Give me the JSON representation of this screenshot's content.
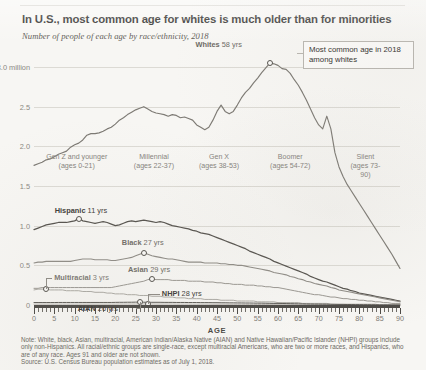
{
  "title": "In U.S., most common age for whites is much older than for minorities",
  "subtitle": "Number of people of each age by race/ethnicity, 2018",
  "callout": "Most common age in 2018 among whites",
  "axis": {
    "x_name": "AGE",
    "x_ticks": [
      0,
      5,
      10,
      15,
      20,
      25,
      30,
      35,
      40,
      45,
      50,
      55,
      60,
      65,
      70,
      75,
      80,
      85,
      90
    ],
    "x_range": [
      0,
      90
    ],
    "y_ticks": [
      "0",
      "0.5",
      "1.0",
      "1.5",
      "2.0",
      "2.5",
      "3.0 million"
    ],
    "y_values": [
      0,
      0.5,
      1.0,
      1.5,
      2.0,
      2.5,
      3.0
    ],
    "y_range": [
      0,
      3.0
    ]
  },
  "generations": [
    {
      "name": "Gen Z and younger",
      "ages": "(ages 0-21)",
      "start": 0,
      "end": 21
    },
    {
      "name": "Millennial",
      "ages": "(ages 22-37)",
      "start": 22,
      "end": 37
    },
    {
      "name": "Gen X",
      "ages": "(ages 38-53)",
      "start": 38,
      "end": 53
    },
    {
      "name": "Boomer",
      "ages": "(ages 54-72)",
      "start": 54,
      "end": 72
    },
    {
      "name": "Silent",
      "ages": "(ages 73-90)",
      "start": 73,
      "end": 90
    }
  ],
  "series_labels": {
    "whites": "Whites 58 yrs",
    "whites_name": "Whites",
    "whites_val": "58 yrs",
    "hispanic_name": "Hispanic",
    "hispanic_val": "11 yrs",
    "black_name": "Black",
    "black_val": "27 yrs",
    "asian_name": "Asian",
    "asian_val": "29 yrs",
    "multiracial_name": "Multiracial",
    "multiracial_val": "3 yrs",
    "nhpi_name": "NHPI",
    "nhpi_val": "28 yrs",
    "aian_name": "AIAN",
    "aian_val": "26 yrs"
  },
  "note": "Note: White, black, Asian, multiracial, American Indian/Alaska Native (AIAN) and Native Hawaiian/Pacific Islander (NHPI) groups include only non-Hispanics. All racial/ethnic groups are single-race, except multiracial Americans, who are two or more races, and Hispanics, who are of any race. Ages 91 and older are not shown.",
  "source": "Source: U.S. Census Bureau population estimates as of July 1, 2018.",
  "colors": {
    "whites": "#7d7a74",
    "hispanic": "#56534e",
    "black": "#8f8c86",
    "asian": "#9a9791",
    "multiracial": "#a8a59f",
    "nhpi": "#b0ada7",
    "aian": "#5c5a55",
    "grid": "#dcdad4",
    "axis": "#4c4a46",
    "background": "#f7f6f3"
  },
  "chart_data": {
    "type": "line",
    "title": "In U.S., most common age for whites is much older than for minorities",
    "subtitle": "Number of people of each age by race/ethnicity, 2018",
    "xlabel": "AGE",
    "ylabel": "Number of people (millions)",
    "xlim": [
      0,
      90
    ],
    "ylim": [
      0,
      3.0
    ],
    "grid": true,
    "legend": "inline-labels",
    "annotations": [
      {
        "text": "Most common age in 2018 among whites",
        "points_to": {
          "series": "Whites",
          "x": 58,
          "y": 3.05
        }
      },
      {
        "text": "Whites 58 yrs",
        "x": 58
      },
      {
        "text": "Hispanic 11 yrs",
        "x": 11
      },
      {
        "text": "Black 27 yrs",
        "x": 27
      },
      {
        "text": "Asian 29 yrs",
        "x": 29
      },
      {
        "text": "Multiracial 3 yrs",
        "x": 3
      },
      {
        "text": "NHPI 28 yrs",
        "x": 28
      },
      {
        "text": "AIAN 26 yrs",
        "x": 26
      }
    ],
    "x": [
      0,
      1,
      2,
      3,
      4,
      5,
      6,
      7,
      8,
      9,
      10,
      11,
      12,
      13,
      14,
      15,
      16,
      17,
      18,
      19,
      20,
      21,
      22,
      23,
      24,
      25,
      26,
      27,
      28,
      29,
      30,
      31,
      32,
      33,
      34,
      35,
      36,
      37,
      38,
      39,
      40,
      41,
      42,
      43,
      44,
      45,
      46,
      47,
      48,
      49,
      50,
      51,
      52,
      53,
      54,
      55,
      56,
      57,
      58,
      59,
      60,
      61,
      62,
      63,
      64,
      65,
      66,
      67,
      68,
      69,
      70,
      71,
      72,
      73,
      74,
      75,
      76,
      77,
      78,
      79,
      80,
      81,
      82,
      83,
      84,
      85,
      86,
      87,
      88,
      89,
      90
    ],
    "series": [
      {
        "name": "Whites",
        "most_common_age": 58,
        "peak_value": 3.05,
        "values": [
          1.76,
          1.78,
          1.8,
          1.83,
          1.84,
          1.87,
          1.9,
          1.92,
          1.94,
          1.99,
          2.02,
          2.04,
          2.08,
          2.14,
          2.16,
          2.16,
          2.17,
          2.19,
          2.22,
          2.24,
          2.28,
          2.33,
          2.36,
          2.4,
          2.43,
          2.46,
          2.48,
          2.5,
          2.47,
          2.44,
          2.42,
          2.41,
          2.4,
          2.38,
          2.4,
          2.39,
          2.36,
          2.37,
          2.35,
          2.33,
          2.27,
          2.24,
          2.21,
          2.24,
          2.33,
          2.44,
          2.52,
          2.44,
          2.41,
          2.44,
          2.52,
          2.61,
          2.68,
          2.73,
          2.8,
          2.86,
          2.93,
          2.99,
          3.05,
          3.04,
          3.02,
          2.98,
          2.97,
          2.92,
          2.84,
          2.77,
          2.68,
          2.58,
          2.47,
          2.36,
          2.27,
          2.22,
          2.38,
          2.22,
          1.92,
          1.74,
          1.62,
          1.52,
          1.44,
          1.36,
          1.28,
          1.2,
          1.12,
          1.04,
          0.96,
          0.88,
          0.8,
          0.72,
          0.64,
          0.55,
          0.46
        ]
      },
      {
        "name": "Hispanic",
        "most_common_age": 11,
        "peak_value": 1.09,
        "values": [
          0.95,
          0.97,
          0.99,
          1.01,
          1.02,
          1.03,
          1.04,
          1.04,
          1.04,
          1.05,
          1.06,
          1.09,
          1.06,
          1.05,
          1.04,
          1.03,
          1.04,
          1.05,
          1.04,
          1.02,
          1.0,
          1.01,
          1.03,
          1.05,
          1.06,
          1.05,
          1.06,
          1.07,
          1.06,
          1.05,
          1.04,
          1.05,
          1.04,
          1.02,
          1.0,
          0.99,
          0.98,
          0.97,
          0.96,
          0.94,
          0.93,
          0.91,
          0.9,
          0.89,
          0.87,
          0.85,
          0.83,
          0.81,
          0.79,
          0.77,
          0.75,
          0.73,
          0.71,
          0.68,
          0.66,
          0.64,
          0.62,
          0.6,
          0.58,
          0.55,
          0.53,
          0.51,
          0.49,
          0.47,
          0.45,
          0.43,
          0.41,
          0.39,
          0.36,
          0.34,
          0.32,
          0.3,
          0.29,
          0.27,
          0.25,
          0.23,
          0.21,
          0.2,
          0.18,
          0.17,
          0.15,
          0.14,
          0.13,
          0.12,
          0.11,
          0.1,
          0.09,
          0.08,
          0.07,
          0.06,
          0.05
        ]
      },
      {
        "name": "Black",
        "most_common_age": 27,
        "peak_value": 0.66,
        "values": [
          0.53,
          0.54,
          0.54,
          0.55,
          0.55,
          0.55,
          0.55,
          0.55,
          0.55,
          0.55,
          0.56,
          0.57,
          0.58,
          0.58,
          0.58,
          0.57,
          0.57,
          0.57,
          0.57,
          0.56,
          0.56,
          0.57,
          0.58,
          0.59,
          0.6,
          0.62,
          0.64,
          0.66,
          0.64,
          0.62,
          0.61,
          0.6,
          0.59,
          0.58,
          0.58,
          0.57,
          0.56,
          0.55,
          0.54,
          0.54,
          0.54,
          0.54,
          0.53,
          0.53,
          0.53,
          0.53,
          0.52,
          0.52,
          0.51,
          0.51,
          0.5,
          0.5,
          0.49,
          0.48,
          0.47,
          0.46,
          0.45,
          0.44,
          0.43,
          0.41,
          0.4,
          0.39,
          0.38,
          0.36,
          0.35,
          0.33,
          0.32,
          0.3,
          0.29,
          0.27,
          0.26,
          0.25,
          0.24,
          0.22,
          0.21,
          0.19,
          0.18,
          0.17,
          0.16,
          0.15,
          0.14,
          0.13,
          0.12,
          0.11,
          0.1,
          0.09,
          0.08,
          0.07,
          0.06,
          0.05,
          0.04
        ]
      },
      {
        "name": "Asian",
        "most_common_age": 29,
        "peak_value": 0.33,
        "values": [
          0.21,
          0.21,
          0.22,
          0.22,
          0.22,
          0.22,
          0.22,
          0.22,
          0.22,
          0.22,
          0.22,
          0.22,
          0.22,
          0.22,
          0.22,
          0.22,
          0.22,
          0.22,
          0.22,
          0.22,
          0.23,
          0.24,
          0.25,
          0.26,
          0.27,
          0.28,
          0.29,
          0.3,
          0.32,
          0.33,
          0.32,
          0.32,
          0.32,
          0.32,
          0.31,
          0.31,
          0.31,
          0.31,
          0.3,
          0.3,
          0.3,
          0.3,
          0.29,
          0.29,
          0.29,
          0.28,
          0.28,
          0.27,
          0.27,
          0.26,
          0.26,
          0.26,
          0.25,
          0.25,
          0.25,
          0.24,
          0.24,
          0.23,
          0.23,
          0.22,
          0.22,
          0.21,
          0.2,
          0.19,
          0.18,
          0.17,
          0.16,
          0.15,
          0.14,
          0.13,
          0.13,
          0.12,
          0.11,
          0.1,
          0.1,
          0.09,
          0.08,
          0.08,
          0.07,
          0.07,
          0.06,
          0.06,
          0.05,
          0.05,
          0.04,
          0.04,
          0.03,
          0.03,
          0.02,
          0.02,
          0.02
        ]
      },
      {
        "name": "Multiracial",
        "most_common_age": 3,
        "peak_value": 0.2,
        "values": [
          0.19,
          0.2,
          0.2,
          0.2,
          0.19,
          0.19,
          0.19,
          0.19,
          0.18,
          0.18,
          0.18,
          0.18,
          0.17,
          0.17,
          0.17,
          0.16,
          0.16,
          0.16,
          0.15,
          0.15,
          0.14,
          0.14,
          0.14,
          0.13,
          0.13,
          0.13,
          0.12,
          0.12,
          0.12,
          0.11,
          0.11,
          0.11,
          0.1,
          0.1,
          0.1,
          0.09,
          0.09,
          0.09,
          0.08,
          0.08,
          0.08,
          0.08,
          0.07,
          0.07,
          0.07,
          0.07,
          0.06,
          0.06,
          0.06,
          0.06,
          0.05,
          0.05,
          0.05,
          0.05,
          0.05,
          0.04,
          0.04,
          0.04,
          0.04,
          0.04,
          0.03,
          0.03,
          0.03,
          0.03,
          0.03,
          0.03,
          0.02,
          0.02,
          0.02,
          0.02,
          0.02,
          0.02,
          0.02,
          0.01,
          0.01,
          0.01,
          0.01,
          0.01,
          0.01,
          0.01,
          0.01,
          0.01,
          0.01,
          0.01,
          0.01,
          0.0,
          0.0,
          0.0,
          0.0,
          0.0,
          0.0
        ]
      },
      {
        "name": "NHPI",
        "most_common_age": 28,
        "peak_value": 0.013,
        "values": [
          0.011,
          0.011,
          0.011,
          0.011,
          0.011,
          0.011,
          0.011,
          0.011,
          0.011,
          0.011,
          0.011,
          0.011,
          0.011,
          0.011,
          0.011,
          0.011,
          0.011,
          0.011,
          0.011,
          0.011,
          0.011,
          0.012,
          0.012,
          0.012,
          0.012,
          0.012,
          0.013,
          0.013,
          0.013,
          0.013,
          0.012,
          0.012,
          0.012,
          0.012,
          0.012,
          0.011,
          0.011,
          0.011,
          0.011,
          0.01,
          0.01,
          0.01,
          0.01,
          0.01,
          0.009,
          0.009,
          0.009,
          0.009,
          0.008,
          0.008,
          0.008,
          0.008,
          0.007,
          0.007,
          0.007,
          0.006,
          0.006,
          0.006,
          0.005,
          0.005,
          0.005,
          0.004,
          0.004,
          0.004,
          0.004,
          0.003,
          0.003,
          0.003,
          0.003,
          0.002,
          0.002,
          0.002,
          0.002,
          0.002,
          0.002,
          0.001,
          0.001,
          0.001,
          0.001,
          0.001,
          0.001,
          0.001,
          0.001,
          0.001,
          0.001,
          0.0,
          0.0,
          0.0,
          0.0,
          0.0,
          0.0
        ]
      },
      {
        "name": "AIAN",
        "most_common_age": 26,
        "peak_value": 0.036,
        "values": [
          0.031,
          0.031,
          0.031,
          0.031,
          0.031,
          0.031,
          0.032,
          0.032,
          0.032,
          0.032,
          0.032,
          0.032,
          0.032,
          0.032,
          0.032,
          0.032,
          0.032,
          0.032,
          0.032,
          0.032,
          0.033,
          0.034,
          0.034,
          0.035,
          0.035,
          0.036,
          0.036,
          0.035,
          0.035,
          0.034,
          0.034,
          0.034,
          0.033,
          0.033,
          0.033,
          0.032,
          0.032,
          0.032,
          0.031,
          0.031,
          0.031,
          0.03,
          0.03,
          0.03,
          0.029,
          0.029,
          0.028,
          0.028,
          0.027,
          0.027,
          0.026,
          0.026,
          0.025,
          0.025,
          0.024,
          0.023,
          0.023,
          0.022,
          0.021,
          0.02,
          0.02,
          0.019,
          0.018,
          0.017,
          0.016,
          0.015,
          0.014,
          0.013,
          0.012,
          0.011,
          0.011,
          0.01,
          0.01,
          0.009,
          0.008,
          0.007,
          0.007,
          0.006,
          0.006,
          0.005,
          0.005,
          0.004,
          0.004,
          0.003,
          0.003,
          0.002,
          0.002,
          0.002,
          0.001,
          0.001,
          0.001
        ]
      }
    ]
  }
}
